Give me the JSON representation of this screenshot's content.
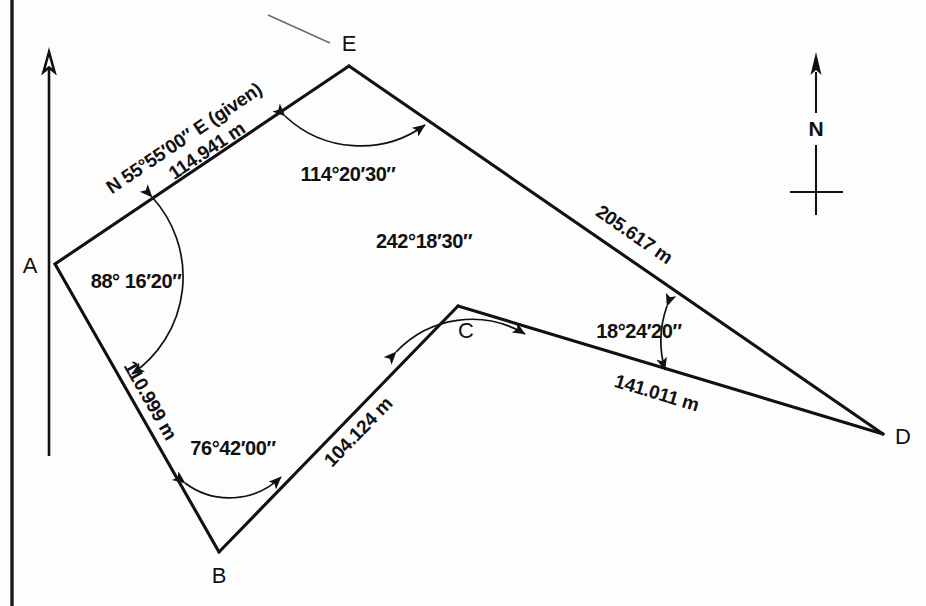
{
  "figure": {
    "units": "m",
    "colors": {
      "line": "#111111",
      "background": "#fdfdfd",
      "leader": "#6d6d6d"
    }
  },
  "compass": {
    "label": "N",
    "icon": "north-arrow-icon"
  },
  "vertices": [
    {
      "id": "A",
      "label": "A",
      "x": 55,
      "y": 264
    },
    {
      "id": "B",
      "label": "B",
      "x": 219,
      "y": 552
    },
    {
      "id": "C",
      "label": "C",
      "x": 458,
      "y": 306
    },
    {
      "id": "D",
      "label": "D",
      "x": 883,
      "y": 434
    },
    {
      "id": "E",
      "label": "E",
      "x": 349,
      "y": 66
    }
  ],
  "sides": [
    {
      "id": "AE",
      "from": "A",
      "to": "E",
      "bearing_label": "N 55°55′00″ E (given)",
      "length_label": "114.941 m",
      "length_value": 114.941
    },
    {
      "id": "AB",
      "from": "A",
      "to": "B",
      "bearing_label": "",
      "length_label": "110.999 m",
      "length_value": 110.999
    },
    {
      "id": "BC",
      "from": "B",
      "to": "C",
      "bearing_label": "",
      "length_label": "104.124 m",
      "length_value": 104.124
    },
    {
      "id": "ED",
      "from": "E",
      "to": "D",
      "bearing_label": "",
      "length_label": "205.617 m",
      "length_value": 205.617
    },
    {
      "id": "CD",
      "from": "C",
      "to": "D",
      "bearing_label": "",
      "length_label": "141.011 m",
      "length_value": 141.011
    }
  ],
  "angles": [
    {
      "id": "angle-A",
      "at": "A",
      "label": "88° 16′20″",
      "degrees": 88,
      "minutes": 16,
      "seconds": 20
    },
    {
      "id": "angle-B",
      "at": "B",
      "label": "76°42′00″",
      "degrees": 76,
      "minutes": 42,
      "seconds": 0
    },
    {
      "id": "angle-C",
      "at": "C",
      "label": "242°18′30″",
      "degrees": 242,
      "minutes": 18,
      "seconds": 30
    },
    {
      "id": "angle-D",
      "at": "D",
      "label": "18°24′20″",
      "degrees": 18,
      "minutes": 24,
      "seconds": 20
    },
    {
      "id": "angle-E",
      "at": "E",
      "label": "114°20′30″",
      "degrees": 114,
      "minutes": 20,
      "seconds": 30
    }
  ]
}
